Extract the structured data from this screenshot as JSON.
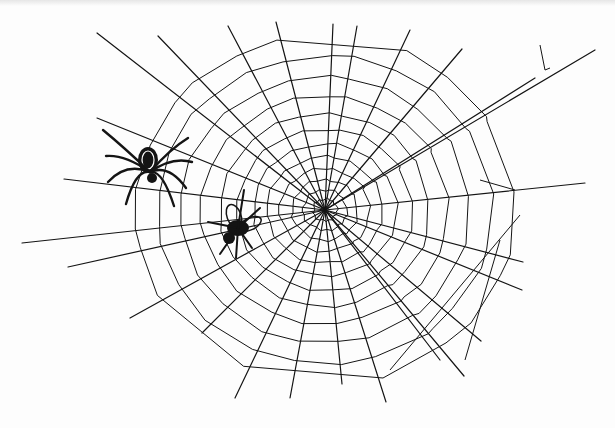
{
  "title": "Pen-and-ink drawing of a spider web with a spider and a trapped fly",
  "colors": {
    "ink": "#141414",
    "paper": "#fdfdfd",
    "faint": "#8a8a8a"
  },
  "hub": {
    "x": 325,
    "y": 210
  },
  "spokes": [
    [
      97,
      33
    ],
    [
      158,
      36
    ],
    [
      228,
      26
    ],
    [
      276,
      22
    ],
    [
      333,
      24
    ],
    [
      357,
      26
    ],
    [
      410,
      30
    ],
    [
      462,
      49
    ],
    [
      535,
      78
    ],
    [
      595,
      50
    ],
    [
      585,
      183
    ],
    [
      523,
      262
    ],
    [
      522,
      290
    ],
    [
      481,
      341
    ],
    [
      464,
      376
    ],
    [
      440,
      360
    ],
    [
      386,
      402
    ],
    [
      342,
      384
    ],
    [
      290,
      398
    ],
    [
      235,
      398
    ],
    [
      202,
      333
    ],
    [
      130,
      318
    ],
    [
      68,
      267
    ],
    [
      22,
      243
    ],
    [
      64,
      179
    ],
    [
      97,
      118
    ]
  ],
  "rings": [
    12,
    22,
    33,
    45,
    58,
    72,
    88,
    105,
    124,
    145,
    168,
    190
  ],
  "anchors": [
    {
      "from": [
        540,
        45
      ],
      "to": [
        545,
        70
      ]
    },
    {
      "from": [
        545,
        70
      ],
      "to": [
        550,
        68
      ]
    },
    {
      "from": [
        480,
        180
      ],
      "to": [
        515,
        190
      ]
    },
    {
      "from": [
        500,
        240
      ],
      "to": [
        465,
        360
      ]
    },
    {
      "from": [
        520,
        215
      ],
      "to": [
        390,
        370
      ]
    }
  ],
  "spider": {
    "x": 148,
    "y": 168,
    "label": "orb-weaver spider"
  },
  "fly": {
    "x": 238,
    "y": 228,
    "label": "trapped fly"
  }
}
